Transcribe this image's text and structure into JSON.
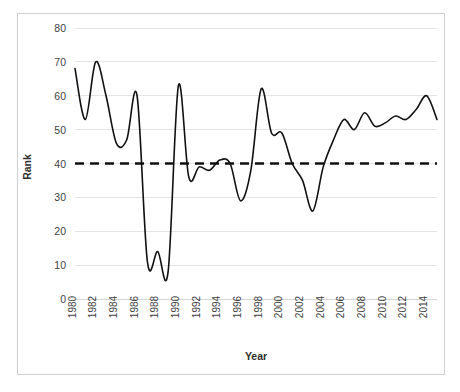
{
  "chart_data": {
    "type": "line",
    "title": "",
    "xlabel": "Year",
    "ylabel": "Rank",
    "xlim": [
      1980,
      2015
    ],
    "ylim": [
      0,
      80
    ],
    "ytick_values": [
      0,
      10,
      20,
      30,
      40,
      50,
      60,
      70,
      80
    ],
    "xtick_labels": [
      "1980",
      "1982",
      "1984",
      "1986",
      "1988",
      "1990",
      "1992",
      "1994",
      "1996",
      "1998",
      "2000",
      "2002",
      "2004",
      "2006",
      "2008",
      "2010",
      "2012",
      "2014"
    ],
    "grid": true,
    "legend": "none",
    "x": [
      1980,
      1981,
      1982,
      1983,
      1984,
      1985,
      1986,
      1987,
      1988,
      1989,
      1990,
      1991,
      1992,
      1993,
      1994,
      1995,
      1996,
      1997,
      1998,
      1999,
      2000,
      2001,
      2002,
      2003,
      2004,
      2005,
      2006,
      2007,
      2008,
      2009,
      2010,
      2011,
      2012,
      2013,
      2014,
      2015
    ],
    "series": [
      {
        "name": "Rank",
        "style": "solid",
        "color": "#111111",
        "values": [
          68,
          53,
          70,
          60,
          46,
          47,
          60,
          11,
          14,
          8,
          63,
          36,
          39,
          38,
          41,
          40,
          29,
          38,
          62,
          49,
          49,
          40,
          35,
          26,
          39,
          47,
          53,
          50,
          55,
          51,
          52,
          54,
          53,
          56,
          60,
          53
        ]
      },
      {
        "name": "Threshold",
        "style": "dashed",
        "color": "#111111",
        "constant": 40
      }
    ]
  },
  "axis": {
    "y_label_text": "Rank",
    "x_label_text": "Year"
  }
}
